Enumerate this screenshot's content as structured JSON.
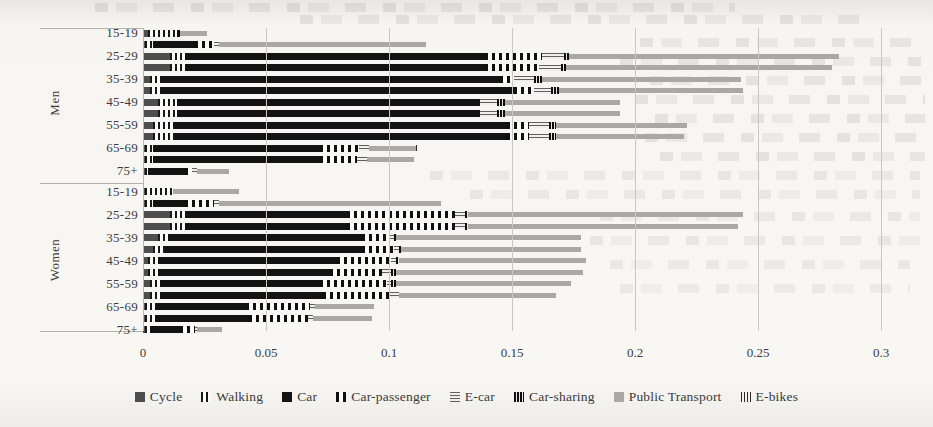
{
  "chart_data": {
    "type": "bar",
    "orientation": "horizontal",
    "stacked": true,
    "title": "",
    "xlabel": "",
    "ylabel": "",
    "xlim": [
      0,
      0.3
    ],
    "xticks": [
      "0",
      "0.05",
      "0.1",
      "0.15",
      "0.2",
      "0.25",
      "0.3"
    ],
    "grid": "vertical-major",
    "legend_position": "bottom",
    "series": [
      {
        "name": "Cycle",
        "pattern": "solid-dark-gray",
        "color": "#4e4e4e"
      },
      {
        "name": "Walking",
        "pattern": "vertical-dashes",
        "color": "#181818"
      },
      {
        "name": "Car",
        "pattern": "solid-black",
        "color": "#131313"
      },
      {
        "name": "Car-passenger",
        "pattern": "wide-vertical-dashes",
        "color": "#101010"
      },
      {
        "name": "E-car",
        "pattern": "horizontal-lines",
        "color": "#5f5f5f"
      },
      {
        "name": "Car-sharing",
        "pattern": "dense-vertical-lines",
        "color": "#0e0e0e"
      },
      {
        "name": "Public Transport",
        "pattern": "solid-light-gray",
        "color": "#a9a8a5"
      },
      {
        "name": "E-bikes",
        "pattern": "thin-vertical-lines",
        "color": "#2a2a2a"
      }
    ],
    "groups": [
      {
        "label": "Men",
        "bars": [
          {
            "label": "15-19",
            "values": [
              0.002,
              0.012,
              0,
              0.001,
              0,
              0,
              0.011,
              0
            ]
          },
          {
            "label": "",
            "values": [
              0.001,
              0.003,
              0.017,
              0.008,
              0.002,
              0,
              0.084,
              0
            ]
          },
          {
            "label": "25-29",
            "values": [
              0.011,
              0.006,
              0.122,
              0.023,
              0.009,
              0.002,
              0.11,
              0
            ]
          },
          {
            "label": "",
            "values": [
              0.011,
              0.006,
              0.122,
              0.022,
              0.009,
              0.002,
              0.108,
              0
            ]
          },
          {
            "label": "35-39",
            "values": [
              0.003,
              0.004,
              0.138,
              0.006,
              0.008,
              0.003,
              0.081,
              0
            ]
          },
          {
            "label": "",
            "values": [
              0.003,
              0.004,
              0.144,
              0.008,
              0.007,
              0.003,
              0.075,
              0
            ]
          },
          {
            "label": "45-49",
            "values": [
              0.006,
              0.008,
              0.122,
              0.001,
              0.007,
              0.003,
              0.047,
              0
            ]
          },
          {
            "label": "",
            "values": [
              0.006,
              0.008,
              0.122,
              0.001,
              0.007,
              0.003,
              0.047,
              0
            ]
          },
          {
            "label": "55-59",
            "values": [
              0.004,
              0.009,
              0.135,
              0.009,
              0.008,
              0.003,
              0.053,
              0
            ]
          },
          {
            "label": "",
            "values": [
              0.004,
              0.009,
              0.135,
              0.009,
              0.008,
              0.003,
              0.052,
              0
            ]
          },
          {
            "label": "65-69",
            "values": [
              0.001,
              0.003,
              0.068,
              0.016,
              0.004,
              0,
              0.019,
              0.001
            ]
          },
          {
            "label": "",
            "values": [
              0.001,
              0.003,
              0.068,
              0.015,
              0.004,
              0,
              0.019,
              0
            ]
          },
          {
            "label": "75+",
            "values": [
              0.001,
              0.001,
              0.015,
              0.003,
              0.002,
              0,
              0.013,
              0
            ]
          }
        ]
      },
      {
        "label": "Women",
        "bars": [
          {
            "label": "15-19",
            "values": [
              0.001,
              0.011,
              0,
              0,
              0,
              0,
              0.027,
              0
            ]
          },
          {
            "label": "",
            "values": [
              0.001,
              0.003,
              0.013,
              0.012,
              0.002,
              0,
              0.09,
              0
            ]
          },
          {
            "label": "25-29",
            "values": [
              0.011,
              0.006,
              0.066,
              0.044,
              0.004,
              0.001,
              0.112,
              0
            ]
          },
          {
            "label": "",
            "values": [
              0.011,
              0.006,
              0.066,
              0.044,
              0.004,
              0.001,
              0.11,
              0
            ]
          },
          {
            "label": "35-39",
            "values": [
              0.006,
              0.004,
              0.079,
              0.011,
              0.002,
              0.001,
              0.075,
              0
            ]
          },
          {
            "label": "",
            "values": [
              0.004,
              0.005,
              0.08,
              0.013,
              0.002,
              0.001,
              0.073,
              0
            ]
          },
          {
            "label": "45-49",
            "values": [
              0.002,
              0.004,
              0.073,
              0.022,
              0.002,
              0.001,
              0.076,
              0
            ]
          },
          {
            "label": "",
            "values": [
              0.002,
              0.004,
              0.07,
              0.021,
              0.004,
              0.002,
              0.076,
              0
            ]
          },
          {
            "label": "55-59",
            "values": [
              0.003,
              0.004,
              0.065,
              0.027,
              0.002,
              0.002,
              0.071,
              0
            ]
          },
          {
            "label": "",
            "values": [
              0.003,
              0.004,
              0.066,
              0.027,
              0.004,
              0,
              0.064,
              0
            ]
          },
          {
            "label": "65-69",
            "values": [
              0.001,
              0.004,
              0.037,
              0.026,
              0.002,
              0,
              0.024,
              0
            ]
          },
          {
            "label": "",
            "values": [
              0.001,
              0.004,
              0.038,
              0.024,
              0.002,
              0,
              0.024,
              0
            ]
          },
          {
            "label": "75+",
            "values": [
              0.001,
              0.002,
              0.012,
              0.006,
              0.001,
              0,
              0.01,
              0
            ]
          }
        ]
      }
    ]
  }
}
